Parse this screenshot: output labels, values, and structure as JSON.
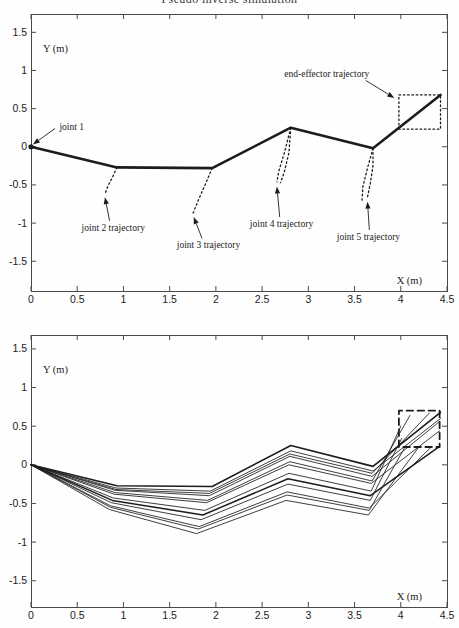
{
  "figure_title": "Pseudo inverse simulation",
  "colors": {
    "ink": "#1c1c1c",
    "frame": "#4a4a4a",
    "background": "#fefefe"
  },
  "chart_data": [
    {
      "type": "line",
      "name": "top-plot",
      "description": "five-link planar arm final configuration with dotted joint and end-effector trajectories",
      "xlabel": "X (m)",
      "ylabel": "Y (m)",
      "xlim": [
        0,
        4.5
      ],
      "ylim": [
        -1.89,
        1.74
      ],
      "grid": false,
      "xticks": [
        0,
        0.5,
        1,
        1.5,
        2,
        2.5,
        3,
        3.5,
        4,
        4.5
      ],
      "xtick_labels": [
        "0",
        "0.5",
        "1",
        "1.5",
        "2",
        "2.5",
        "3",
        "3.5",
        "4",
        "4.5"
      ],
      "yticks": [
        -1.5,
        -1,
        -0.5,
        0,
        0.5,
        1,
        1.5
      ],
      "ytick_labels": [
        "-1.5",
        "-1",
        "-0.5",
        "0",
        "0.5",
        "1",
        "1.5"
      ],
      "series": [
        {
          "name": "arm-links",
          "style": "solid",
          "width": 2.6,
          "points": [
            [
              0,
              0
            ],
            [
              0.93,
              -0.27
            ],
            [
              1.96,
              -0.28
            ],
            [
              2.81,
              0.25
            ],
            [
              3.7,
              -0.02
            ],
            [
              4.43,
              0.68
            ]
          ]
        },
        {
          "name": "joint-2-trajectory",
          "style": "dotted",
          "width": 1.3,
          "points": [
            [
              0.93,
              -0.27
            ],
            [
              0.88,
              -0.4
            ],
            [
              0.83,
              -0.52
            ],
            [
              0.8,
              -0.62
            ]
          ]
        },
        {
          "name": "joint-3-trajectory",
          "style": "dotted",
          "width": 1.3,
          "points": [
            [
              1.96,
              -0.28
            ],
            [
              1.89,
              -0.48
            ],
            [
              1.81,
              -0.7
            ],
            [
              1.75,
              -0.88
            ]
          ]
        },
        {
          "name": "joint-4-trajectory-left",
          "style": "dotted",
          "width": 1.3,
          "points": [
            [
              2.81,
              0.25
            ],
            [
              2.74,
              -0.08
            ],
            [
              2.68,
              -0.32
            ],
            [
              2.66,
              -0.46
            ]
          ]
        },
        {
          "name": "joint-4-trajectory-right",
          "style": "dotted",
          "width": 1.3,
          "points": [
            [
              2.81,
              0.25
            ],
            [
              2.79,
              -0.08
            ],
            [
              2.74,
              -0.33
            ],
            [
              2.7,
              -0.47
            ]
          ]
        },
        {
          "name": "joint-5-trajectory-left",
          "style": "dotted",
          "width": 1.3,
          "points": [
            [
              3.7,
              -0.02
            ],
            [
              3.64,
              -0.28
            ],
            [
              3.59,
              -0.52
            ],
            [
              3.58,
              -0.7
            ]
          ]
        },
        {
          "name": "joint-5-trajectory-right",
          "style": "dotted",
          "width": 1.3,
          "points": [
            [
              3.7,
              -0.02
            ],
            [
              3.7,
              -0.25
            ],
            [
              3.67,
              -0.48
            ],
            [
              3.64,
              -0.66
            ]
          ]
        },
        {
          "name": "end-effector-square-path",
          "style": "dotted",
          "width": 1.3,
          "points": [
            [
              3.98,
              0.23
            ],
            [
              3.98,
              0.68
            ],
            [
              4.43,
              0.68
            ],
            [
              4.43,
              0.23
            ],
            [
              3.98,
              0.23
            ]
          ]
        }
      ],
      "markers": [
        {
          "name": "joint-1-marker",
          "x": 0,
          "y": 0,
          "r": 2.6
        }
      ],
      "annotations": [
        {
          "text": "joint 1",
          "x": 0.44,
          "y": 0.22,
          "arrow_from": [
            0.26,
            0.24
          ],
          "arrow_to": [
            0.02,
            0.03
          ]
        },
        {
          "text": "end-effector trajectory",
          "x": 3.2,
          "y": 0.92,
          "arrow_from": [
            3.62,
            0.87
          ],
          "arrow_to": [
            3.93,
            0.64
          ]
        },
        {
          "text": "joint 2 trajectory",
          "x": 0.89,
          "y": -1.1,
          "arrow_from": [
            0.85,
            -0.97
          ],
          "arrow_to": [
            0.8,
            -0.66
          ]
        },
        {
          "text": "joint 3 trajectory",
          "x": 1.92,
          "y": -1.33,
          "arrow_from": [
            1.85,
            -1.2
          ],
          "arrow_to": [
            1.76,
            -0.92
          ]
        },
        {
          "text": "joint 4 trajectory",
          "x": 2.71,
          "y": -1.05,
          "arrow_from": [
            2.69,
            -0.92
          ],
          "arrow_to": [
            2.66,
            -0.52
          ]
        },
        {
          "text": "joint 5 trajectory",
          "x": 3.65,
          "y": -1.22,
          "arrow_from": [
            3.66,
            -1.09
          ],
          "arrow_to": [
            3.64,
            -0.72
          ]
        }
      ]
    },
    {
      "type": "line",
      "name": "bottom-plot",
      "description": "overlaid arm configurations while the end-effector traces the dashed square path",
      "xlabel": "X (m)",
      "ylabel": "Y (m)",
      "xlim": [
        0,
        4.5
      ],
      "ylim": [
        -1.84,
        1.68
      ],
      "grid": false,
      "xticks": [
        0,
        0.5,
        1,
        1.5,
        2,
        2.5,
        3,
        3.5,
        4,
        4.5
      ],
      "xtick_labels": [
        "0",
        "0.5",
        "1",
        "1.5",
        "2",
        "2.5",
        "3",
        "3.5",
        "4",
        "4.5"
      ],
      "yticks": [
        -1.5,
        -1,
        -0.5,
        0,
        0.5,
        1,
        1.5
      ],
      "ytick_labels": [
        "-1.5",
        "-1",
        "-0.5",
        "0",
        "0.5",
        "1",
        "1.5"
      ],
      "series": [
        {
          "name": "arm-snapshot-0",
          "style": "solid",
          "width": 1.6,
          "points": [
            [
              0,
              0
            ],
            [
              0.93,
              -0.27
            ],
            [
              1.96,
              -0.28
            ],
            [
              2.81,
              0.25
            ],
            [
              3.7,
              -0.02
            ],
            [
              4.43,
              0.68
            ]
          ]
        },
        {
          "name": "arm-snapshot-1",
          "style": "solid",
          "width": 0.85,
          "points": [
            [
              0,
              0
            ],
            [
              0.92,
              -0.3
            ],
            [
              1.94,
              -0.34
            ],
            [
              2.81,
              0.18
            ],
            [
              3.7,
              -0.08
            ],
            [
              4.43,
              0.6
            ]
          ]
        },
        {
          "name": "arm-snapshot-2",
          "style": "solid",
          "width": 0.85,
          "points": [
            [
              0,
              0
            ],
            [
              0.92,
              -0.32
            ],
            [
              1.93,
              -0.37
            ],
            [
              2.8,
              0.14
            ],
            [
              3.69,
              -0.11
            ],
            [
              4.31,
              0.67
            ]
          ]
        },
        {
          "name": "arm-snapshot-3",
          "style": "solid",
          "width": 0.85,
          "points": [
            [
              0,
              0
            ],
            [
              0.91,
              -0.36
            ],
            [
              1.91,
              -0.46
            ],
            [
              2.8,
              0.04
            ],
            [
              3.69,
              -0.21
            ],
            [
              4.1,
              0.64
            ]
          ]
        },
        {
          "name": "arm-snapshot-4",
          "style": "solid",
          "width": 0.85,
          "points": [
            [
              0,
              0
            ],
            [
              0.89,
              -0.43
            ],
            [
              1.88,
              -0.59
            ],
            [
              2.79,
              -0.11
            ],
            [
              3.68,
              -0.34
            ],
            [
              4.0,
              0.5
            ]
          ]
        },
        {
          "name": "arm-snapshot-5",
          "style": "solid",
          "width": 0.85,
          "points": [
            [
              0,
              0
            ],
            [
              0.87,
              -0.49
            ],
            [
              1.84,
              -0.71
            ],
            [
              2.78,
              -0.25
            ],
            [
              3.67,
              -0.46
            ],
            [
              4.01,
              0.34
            ]
          ]
        },
        {
          "name": "arm-snapshot-6",
          "style": "solid",
          "width": 0.85,
          "points": [
            [
              0,
              0
            ],
            [
              0.86,
              -0.55
            ],
            [
              1.81,
              -0.83
            ],
            [
              2.77,
              -0.39
            ],
            [
              3.66,
              -0.59
            ],
            [
              4.05,
              0.24
            ]
          ]
        },
        {
          "name": "arm-snapshot-7",
          "style": "solid",
          "width": 0.85,
          "points": [
            [
              0,
              0
            ],
            [
              0.85,
              -0.58
            ],
            [
              1.79,
              -0.89
            ],
            [
              2.76,
              -0.46
            ],
            [
              3.65,
              -0.65
            ],
            [
              4.19,
              0.22
            ]
          ]
        },
        {
          "name": "arm-snapshot-8",
          "style": "solid",
          "width": 0.85,
          "points": [
            [
              0,
              0
            ],
            [
              0.86,
              -0.53
            ],
            [
              1.82,
              -0.8
            ],
            [
              2.77,
              -0.35
            ],
            [
              3.66,
              -0.56
            ],
            [
              4.32,
              0.22
            ]
          ]
        },
        {
          "name": "arm-snapshot-9",
          "style": "solid",
          "width": 1.5,
          "points": [
            [
              0,
              0
            ],
            [
              0.88,
              -0.46
            ],
            [
              1.86,
              -0.65
            ],
            [
              2.78,
              -0.18
            ],
            [
              3.67,
              -0.4
            ],
            [
              4.42,
              0.24
            ]
          ]
        },
        {
          "name": "arm-snapshot-10",
          "style": "solid",
          "width": 0.85,
          "points": [
            [
              0,
              0
            ],
            [
              0.9,
              -0.38
            ],
            [
              1.9,
              -0.49
            ],
            [
              2.79,
              0.0
            ],
            [
              3.68,
              -0.24
            ],
            [
              4.42,
              0.44
            ]
          ]
        },
        {
          "name": "arm-snapshot-11",
          "style": "solid",
          "width": 0.85,
          "points": [
            [
              0,
              0
            ],
            [
              0.91,
              -0.33
            ],
            [
              1.93,
              -0.4
            ],
            [
              2.8,
              0.11
            ],
            [
              3.69,
              -0.15
            ],
            [
              4.42,
              0.56
            ]
          ]
        },
        {
          "name": "end-effector-square-path",
          "style": "dashed",
          "width": 1.8,
          "points": [
            [
              3.98,
              0.23
            ],
            [
              3.98,
              0.7
            ],
            [
              4.42,
              0.7
            ],
            [
              4.42,
              0.23
            ],
            [
              3.98,
              0.23
            ]
          ]
        }
      ],
      "markers": [],
      "annotations": []
    }
  ]
}
